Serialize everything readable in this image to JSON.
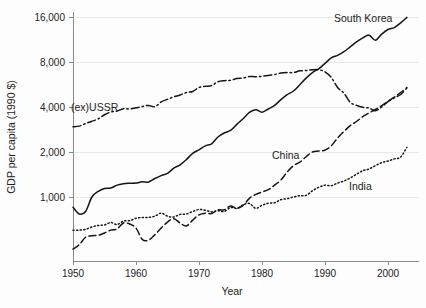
{
  "chart_data": {
    "type": "line",
    "title": "",
    "xlabel": "Year",
    "ylabel": "GDP per capita (1990 $)",
    "yscale": "log",
    "ylim": [
      500,
      16000
    ],
    "xlim": [
      1950,
      2003
    ],
    "grid": true,
    "legend_position": "inline-annotations",
    "ytick_labels": [
      "16,000",
      "8,000",
      "4,000",
      "2,000",
      "1,000"
    ],
    "ytick_values": [
      16000,
      8000,
      4000,
      2000,
      1000
    ],
    "xtick_labels": [
      "1950",
      "1960",
      "1970",
      "1980",
      "1990",
      "2000"
    ],
    "xtick_values": [
      1950,
      1960,
      1970,
      1980,
      1990,
      2000
    ],
    "series": [
      {
        "name": "South Korea",
        "label": "South Korea",
        "style": "solid",
        "x": [
          1950,
          1951,
          1952,
          1953,
          1954,
          1955,
          1956,
          1957,
          1958,
          1959,
          1960,
          1961,
          1962,
          1963,
          1964,
          1965,
          1966,
          1967,
          1968,
          1969,
          1970,
          1971,
          1972,
          1973,
          1974,
          1975,
          1976,
          1977,
          1978,
          1979,
          1980,
          1981,
          1982,
          1983,
          1984,
          1985,
          1986,
          1987,
          1988,
          1989,
          1990,
          1991,
          1992,
          1993,
          1994,
          1995,
          1996,
          1997,
          1998,
          1999,
          2000,
          2001,
          2002,
          2003
        ],
        "values": [
          854,
          770,
          800,
          1000,
          1090,
          1140,
          1150,
          1200,
          1225,
          1235,
          1240,
          1265,
          1260,
          1330,
          1390,
          1440,
          1560,
          1640,
          1780,
          1960,
          2070,
          2200,
          2270,
          2520,
          2680,
          2790,
          3060,
          3340,
          3680,
          3840,
          3690,
          3880,
          4100,
          4480,
          4840,
          5120,
          5640,
          6240,
          6800,
          7200,
          7830,
          8530,
          8860,
          9370,
          10100,
          10900,
          11600,
          12100,
          11200,
          12300,
          13200,
          13600,
          14600,
          15900
        ]
      },
      {
        "name": "(ex)USSR",
        "label": "(ex)USSR",
        "style": "dash-dot",
        "x": [
          1950,
          1951,
          1952,
          1953,
          1954,
          1955,
          1956,
          1957,
          1958,
          1959,
          1960,
          1961,
          1962,
          1963,
          1964,
          1965,
          1966,
          1967,
          1968,
          1969,
          1970,
          1971,
          1972,
          1973,
          1974,
          1975,
          1976,
          1977,
          1978,
          1979,
          1980,
          1981,
          1982,
          1983,
          1984,
          1985,
          1986,
          1987,
          1988,
          1989,
          1990,
          1991,
          1992,
          1993,
          1994,
          1995,
          1996,
          1997,
          1998,
          1999,
          2000,
          2001,
          2002,
          2003
        ],
        "values": [
          2950,
          2980,
          3100,
          3210,
          3330,
          3550,
          3700,
          3760,
          3900,
          3880,
          3950,
          4030,
          4100,
          4020,
          4330,
          4500,
          4680,
          4810,
          5000,
          5080,
          5400,
          5500,
          5560,
          5900,
          6000,
          6030,
          6200,
          6250,
          6400,
          6370,
          6420,
          6500,
          6600,
          6750,
          6800,
          6800,
          6980,
          7020,
          7100,
          7100,
          6880,
          6300,
          5400,
          4950,
          4300,
          4100,
          3980,
          3940,
          3780,
          4000,
          4350,
          4600,
          4850,
          5350
        ]
      },
      {
        "name": "China",
        "label": "China",
        "style": "dashed",
        "x": [
          1950,
          1951,
          1952,
          1953,
          1954,
          1955,
          1956,
          1957,
          1958,
          1959,
          1960,
          1961,
          1962,
          1963,
          1964,
          1965,
          1966,
          1967,
          1968,
          1969,
          1970,
          1971,
          1972,
          1973,
          1974,
          1975,
          1976,
          1977,
          1978,
          1979,
          1980,
          1981,
          1982,
          1983,
          1984,
          1985,
          1986,
          1987,
          1988,
          1989,
          1990,
          1991,
          1992,
          1993,
          1994,
          1995,
          1996,
          1997,
          1998,
          1999,
          2000,
          2001,
          2002,
          2003
        ],
        "values": [
          448,
          480,
          538,
          550,
          555,
          575,
          600,
          612,
          670,
          660,
          620,
          520,
          515,
          560,
          620,
          680,
          715,
          670,
          640,
          700,
          760,
          780,
          775,
          820,
          820,
          870,
          840,
          880,
          980,
          1040,
          1080,
          1120,
          1200,
          1300,
          1470,
          1620,
          1710,
          1860,
          2000,
          2030,
          2060,
          2200,
          2480,
          2740,
          3000,
          3200,
          3450,
          3650,
          3850,
          4080,
          4360,
          4650,
          5000,
          5400
        ]
      },
      {
        "name": "India",
        "label": "India",
        "style": "dotted",
        "x": [
          1950,
          1951,
          1952,
          1953,
          1954,
          1955,
          1956,
          1957,
          1958,
          1959,
          1960,
          1961,
          1962,
          1963,
          1964,
          1965,
          1966,
          1967,
          1968,
          1969,
          1970,
          1971,
          1972,
          1973,
          1974,
          1975,
          1976,
          1977,
          1978,
          1979,
          1980,
          1981,
          1982,
          1983,
          1984,
          1985,
          1986,
          1987,
          1988,
          1989,
          1990,
          1991,
          1992,
          1993,
          1994,
          1995,
          1996,
          1997,
          1998,
          1999,
          2000,
          2001,
          2002,
          2003
        ],
        "values": [
          600,
          600,
          608,
          630,
          645,
          650,
          675,
          655,
          690,
          695,
          720,
          730,
          730,
          745,
          780,
          745,
          735,
          765,
          770,
          800,
          825,
          815,
          795,
          810,
          800,
          850,
          840,
          885,
          905,
          840,
          880,
          910,
          915,
          960,
          975,
          1000,
          1020,
          1025,
          1100,
          1160,
          1200,
          1190,
          1240,
          1280,
          1340,
          1420,
          1500,
          1540,
          1620,
          1700,
          1740,
          1800,
          1850,
          2150
        ]
      }
    ]
  },
  "annotations": {
    "south_korea": "South Korea",
    "ex_ussr": "(ex)USSR",
    "china": "China",
    "india": "India"
  },
  "colors": {
    "line": "#151515",
    "grid": "#e9e9e9",
    "axis": "#8a8a8a",
    "text": "#1c1c1c",
    "background": "#fdfdfd"
  }
}
